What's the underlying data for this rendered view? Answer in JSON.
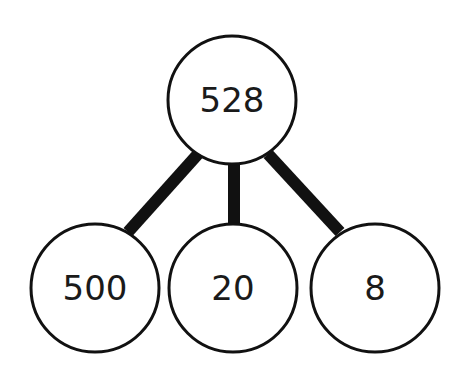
{
  "diagram": {
    "type": "number-bond",
    "root": {
      "label": "528",
      "cx": 232,
      "cy": 100,
      "r": 64
    },
    "children": [
      {
        "label": "500",
        "cx": 95,
        "cy": 288,
        "r": 64
      },
      {
        "label": "20",
        "cx": 233,
        "cy": 288,
        "r": 64
      },
      {
        "label": "8",
        "cx": 375,
        "cy": 288,
        "r": 64
      }
    ],
    "colors": {
      "stroke": "#111111",
      "fill": "#ffffff",
      "text": "#1a1a1a"
    }
  }
}
